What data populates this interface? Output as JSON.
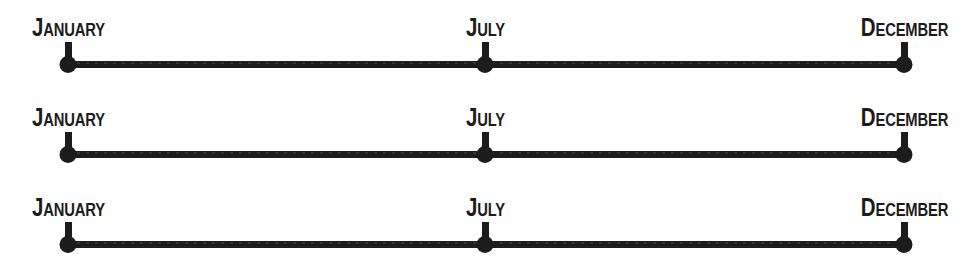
{
  "figure": {
    "type": "timeline",
    "background_color": "#ffffff",
    "ink_color": "#1c1c1c",
    "row_count": 3,
    "row_pitch_px": 90
  },
  "geometry": {
    "axis_left_px": 68,
    "axis_right_px": 904,
    "axis_mid_px": 485,
    "axis_thickness_px": 7,
    "tick_height_px": 22,
    "dot_diameter_px": 17,
    "baselines_px": [
      64,
      154,
      244
    ]
  },
  "timelines": [
    {
      "id": "timeline-1",
      "baseline_y": 64,
      "nodes": [
        {
          "label": "January",
          "label_cap": "J",
          "label_rest": "ANUARY",
          "x": 68,
          "position": "start"
        },
        {
          "label": "July",
          "label_cap": "J",
          "label_rest": "ULY",
          "x": 485,
          "position": "middle"
        },
        {
          "label": "December",
          "label_cap": "D",
          "label_rest": "ECEMBER",
          "x": 904,
          "position": "end"
        }
      ]
    },
    {
      "id": "timeline-2",
      "baseline_y": 154,
      "nodes": [
        {
          "label": "January",
          "label_cap": "J",
          "label_rest": "ANUARY",
          "x": 68,
          "position": "start"
        },
        {
          "label": "July",
          "label_cap": "J",
          "label_rest": "ULY",
          "x": 485,
          "position": "middle"
        },
        {
          "label": "December",
          "label_cap": "D",
          "label_rest": "ECEMBER",
          "x": 904,
          "position": "end"
        }
      ]
    },
    {
      "id": "timeline-3",
      "baseline_y": 244,
      "nodes": [
        {
          "label": "January",
          "label_cap": "J",
          "label_rest": "ANUARY",
          "x": 68,
          "position": "start"
        },
        {
          "label": "July",
          "label_cap": "J",
          "label_rest": "ULY",
          "x": 485,
          "position": "middle"
        },
        {
          "label": "December",
          "label_cap": "D",
          "label_rest": "ECEMBER",
          "x": 904,
          "position": "end"
        }
      ]
    }
  ]
}
